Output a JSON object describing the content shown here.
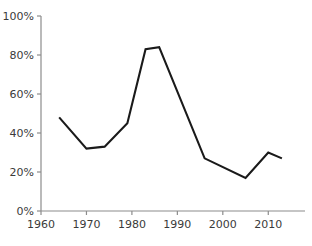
{
  "chart_data": {
    "type": "line",
    "title": "",
    "subtitle": "",
    "xlabel": "",
    "ylabel": "",
    "xlim": [
      1960,
      2015
    ],
    "ylim": [
      0,
      100
    ],
    "grid": false,
    "legend": null,
    "line_color": "#1a1a1a",
    "axis_color": "#8c8c8c",
    "text_color": "#3a3a3a",
    "x_ticks": [
      1960,
      1970,
      1980,
      1990,
      2000,
      2010
    ],
    "x_tick_labels": [
      "1960",
      "1970",
      "1980",
      "1990",
      "2000",
      "2010"
    ],
    "y_ticks": [
      0,
      20,
      40,
      60,
      80,
      100
    ],
    "y_tick_labels": [
      "0%",
      "20%",
      "40%",
      "60%",
      "80%",
      "100%"
    ],
    "series": [
      {
        "name": "series-1",
        "x": [
          1964,
          1970,
          1974,
          1979,
          1983,
          1986,
          1996,
          2005,
          2010,
          2013
        ],
        "values": [
          48,
          32,
          33,
          45,
          83,
          84,
          27,
          17,
          30,
          27
        ]
      }
    ]
  }
}
